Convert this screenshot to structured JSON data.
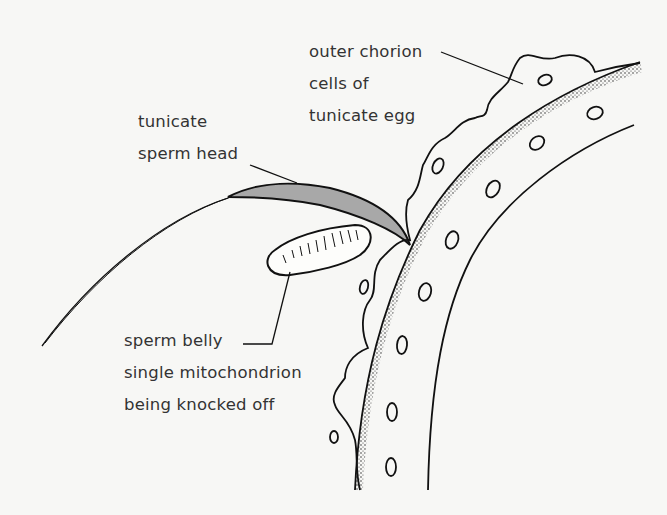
{
  "diagram": {
    "labels": {
      "chorion": [
        "outer chorion",
        "cells of",
        "tunicate egg"
      ],
      "sperm_head": [
        "tunicate",
        "sperm head"
      ],
      "sperm_belly": [
        "sperm belly",
        "single mitochondrion",
        "being knocked off"
      ]
    },
    "colors": {
      "background": "#f7f7f5",
      "ink": "#111111",
      "sperm_head_fill": "#a8a8a8",
      "text": "#333333"
    }
  }
}
